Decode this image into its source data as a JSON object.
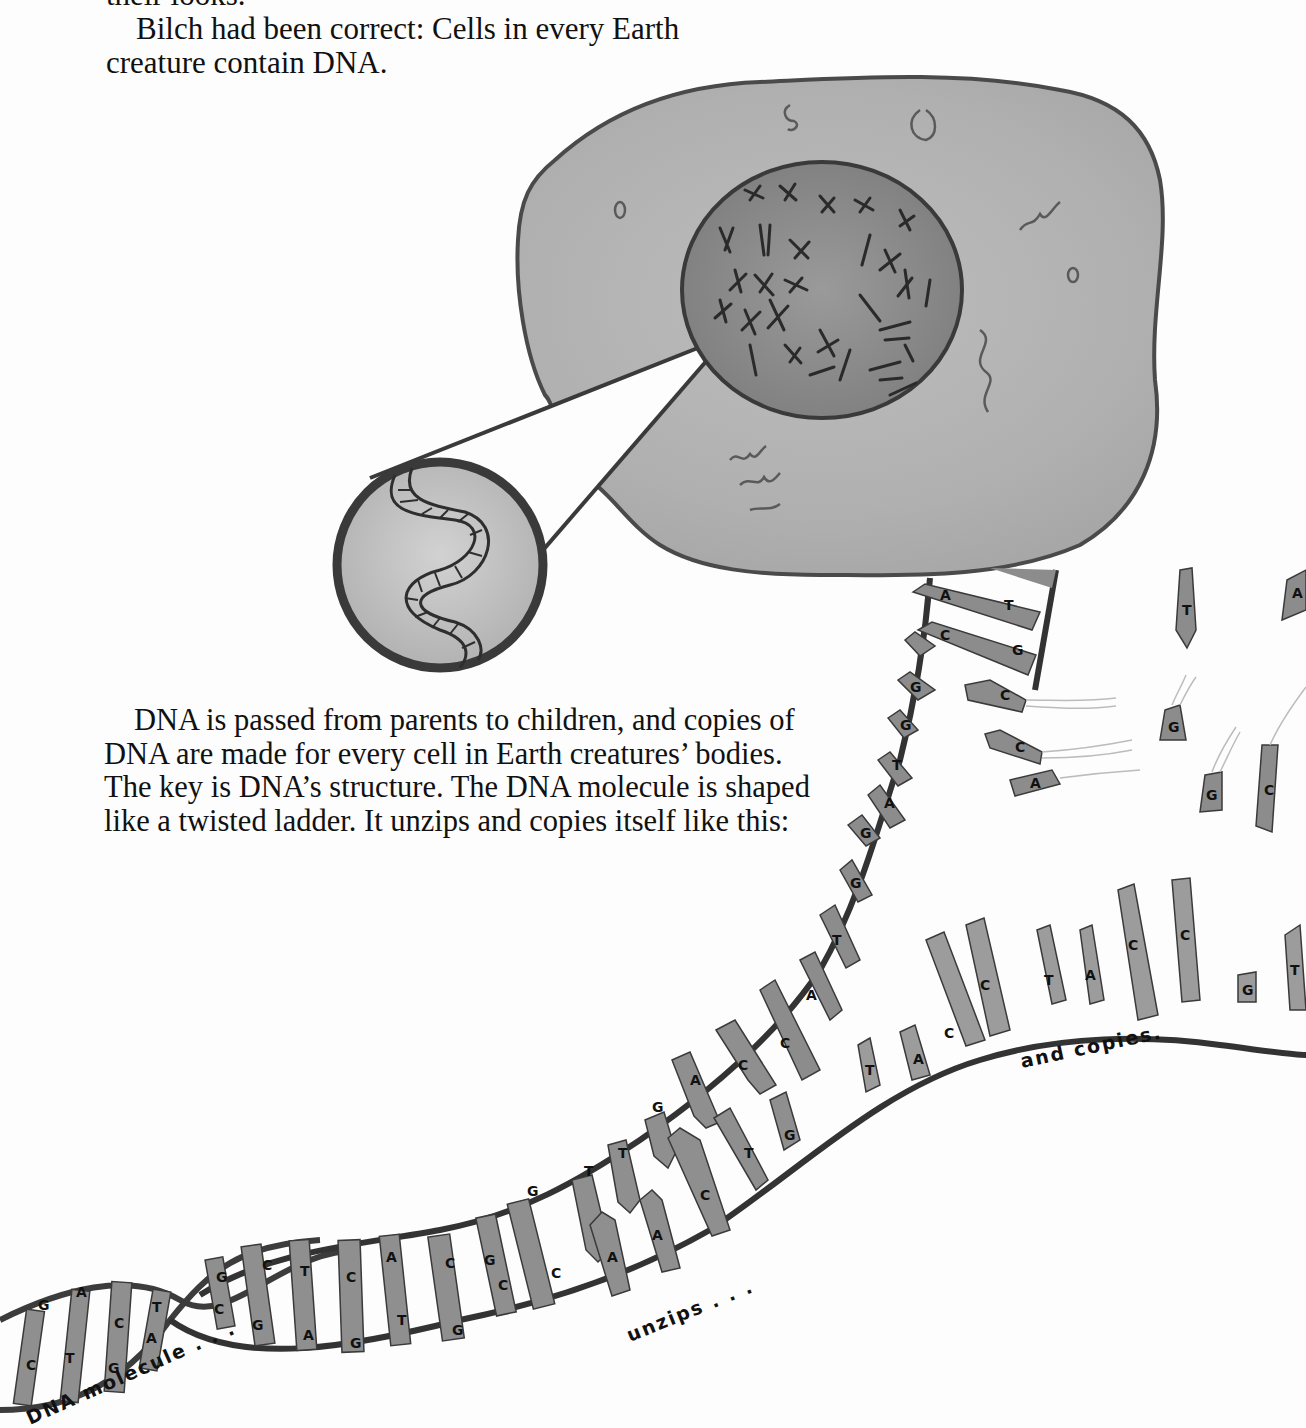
{
  "page": {
    "top_text": {
      "line0": "their looks.",
      "paragraph": "Bilch had been correct:  Cells in every Earth creature contain DNA."
    },
    "middle_text": {
      "paragraph": "DNA is passed from parents to children, and copies of DNA are made for every cell in Earth creatures’ bodies.  The key is DNA’s structure. The DNA molecule is shaped like a twisted ladder. It unzips and copies itself like this:"
    },
    "illustration": {
      "cell": {
        "label": "cell with nucleus containing chromosomes",
        "fill": "#b4b4b4",
        "nucleus_fill": "#8e8e8e",
        "outline": "#4a4a4a"
      },
      "zoom_circle": {
        "label": "magnified DNA double helix",
        "fill": "#c8c8c8",
        "outline": "#3c3c3c"
      },
      "dna": {
        "captions": {
          "molecule": "DNA molecule . . .",
          "unzips": "unzips . . .",
          "copies": "and copies."
        },
        "helix_pairs": [
          {
            "top": "G",
            "bottom": "C"
          },
          {
            "top": "A",
            "bottom": "T"
          },
          {
            "top": "C",
            "bottom": "G"
          },
          {
            "top": "T",
            "bottom": "A"
          },
          {
            "top": "G",
            "bottom": "C"
          },
          {
            "top": "C",
            "bottom": "G"
          },
          {
            "top": "T",
            "bottom": "A"
          },
          {
            "top": "C",
            "bottom": "G"
          },
          {
            "top": "A",
            "bottom": "T"
          },
          {
            "top": "C",
            "bottom": "G"
          },
          {
            "top": "C",
            "bottom": "C"
          }
        ],
        "unzipping_pairs": [
          {
            "top": "G",
            "bottom": "C"
          },
          {
            "top": "G",
            "bottom": "C"
          },
          {
            "top": "T",
            "bottom": "A"
          },
          {
            "top": "T",
            "bottom": "A"
          },
          {
            "top": "G",
            "bottom": "C"
          },
          {
            "top": "A",
            "bottom": "T"
          },
          {
            "top": "C",
            "bottom": "G"
          },
          {
            "top": "C",
            "bottom": "G"
          }
        ],
        "upper_strand_bases": [
          "C",
          "A",
          "T",
          "G",
          "G",
          "A",
          "T",
          "G",
          "G",
          "C",
          "A"
        ],
        "lower_strand_bases": [
          "T",
          "A",
          "C",
          "C",
          "T",
          "A",
          "C",
          "C",
          "G",
          "T"
        ],
        "top_ladder_pairs": [
          {
            "left": "A",
            "right": "T"
          },
          {
            "left": "C",
            "right": "G"
          }
        ],
        "floating_bases": [
          "C",
          "C",
          "A",
          "T",
          "A",
          "G",
          "G",
          "C"
        ]
      }
    }
  }
}
